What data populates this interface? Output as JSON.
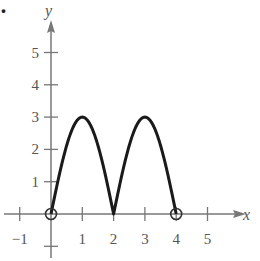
{
  "figure": {
    "label_fragment": "."
  },
  "chart_data": {
    "type": "line",
    "title": "",
    "xlabel": "x",
    "ylabel": "y",
    "xlim": [
      -1.5,
      6
    ],
    "ylim": [
      -1,
      6
    ],
    "grid": false,
    "x_ticks": [
      -1,
      1,
      2,
      3,
      4,
      5
    ],
    "x_tick_labels": [
      "−1",
      "1",
      "2",
      "3",
      "4",
      "5"
    ],
    "y_ticks": [
      1,
      2,
      3,
      4,
      5
    ],
    "y_tick_labels": [
      "1",
      "2",
      "3",
      "4",
      "5"
    ],
    "series": [
      {
        "name": "f(x)",
        "description": "Two arches: 3|sin(pi x / 2)| on [0,4]",
        "x": [
          0,
          0.25,
          0.5,
          0.75,
          1,
          1.25,
          1.5,
          1.75,
          2,
          2.25,
          2.5,
          2.75,
          3,
          3.25,
          3.5,
          3.75,
          4
        ],
        "y": [
          0,
          1.15,
          2.12,
          2.77,
          3,
          2.77,
          2.12,
          1.15,
          0,
          1.15,
          2.12,
          2.77,
          3,
          2.77,
          2.12,
          1.15,
          0
        ]
      }
    ],
    "open_endpoints": [
      [
        0,
        0
      ],
      [
        4,
        0
      ]
    ],
    "colors": {
      "axis": "#777777",
      "curve": "#1a1a1a",
      "text": "#555555"
    }
  }
}
